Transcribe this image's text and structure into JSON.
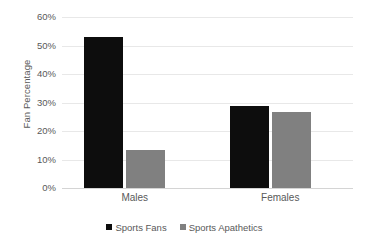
{
  "chart_data": {
    "type": "bar",
    "title": "",
    "subtitle": "",
    "xlabel": "",
    "ylabel": "Fan Percentage",
    "categories": [
      "Males",
      "Females"
    ],
    "series": [
      {
        "name": "Sports Fans",
        "color": "#0d0d0d",
        "values": [
          53.0,
          28.8
        ]
      },
      {
        "name": "Sports Apathetics",
        "color": "#808080",
        "values": [
          13.5,
          26.7
        ]
      }
    ],
    "ylim": [
      0,
      60
    ],
    "y_ticks": [
      0,
      10,
      20,
      30,
      40,
      50,
      60
    ],
    "y_tick_labels": [
      "0%",
      "10%",
      "20%",
      "30%",
      "40%",
      "50%",
      "60%"
    ],
    "grid": true,
    "legend_position": "bottom",
    "annotations": []
  },
  "legend": {
    "items": [
      {
        "label": "Sports Fans",
        "swatch_name": "legend-swatch-sports-fans"
      },
      {
        "label": "Sports Apathetics",
        "swatch_name": "legend-swatch-sports-apathetics"
      }
    ]
  },
  "colors": {
    "series_fans": "#0d0d0d",
    "series_apathetics": "#808080",
    "gridline": "#e8e8e8",
    "axis": "#d4d4d4",
    "text": "#595959",
    "background": "#ffffff"
  }
}
